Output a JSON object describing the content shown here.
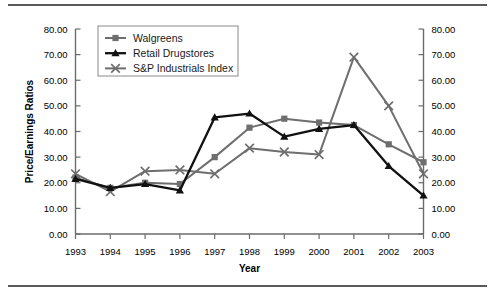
{
  "chart_data": {
    "type": "line",
    "title": "",
    "xlabel": "Year",
    "ylabel": "Price/Earnings Ratios",
    "ylabel_right": "",
    "categories": [
      "1993",
      "1994",
      "1995",
      "1996",
      "1997",
      "1998",
      "1999",
      "2000",
      "2001",
      "2002",
      "2003"
    ],
    "ylim": [
      0,
      80
    ],
    "ytick_step": 10,
    "ytick_labels": [
      "0.00",
      "10.00",
      "20.00",
      "30.00",
      "40.00",
      "50.00",
      "60.00",
      "70.00",
      "80.00"
    ],
    "ytick_labels_right": [
      "0.00",
      "10.00",
      "20.00",
      "30.00",
      "40.00",
      "50.00",
      "60.00",
      "70.00",
      "80.00"
    ],
    "grid": false,
    "dual_axis": true,
    "legend_position": "top-left-inside",
    "series": [
      {
        "name": "Walgreens",
        "color": "#6e6e6e",
        "marker": "square",
        "values": [
          22.0,
          18.0,
          20.0,
          19.5,
          30.0,
          41.5,
          45.0,
          43.5,
          42.5,
          35.0,
          28.0
        ]
      },
      {
        "name": "Retail Drugstores",
        "color": "#111111",
        "marker": "triangle",
        "values": [
          21.5,
          18.0,
          19.5,
          17.0,
          45.5,
          47.0,
          38.0,
          41.0,
          42.5,
          26.5,
          15.0
        ]
      },
      {
        "name": "S&P Industrials Index",
        "color": "#6e6e6e",
        "marker": "cross",
        "values": [
          23.5,
          16.5,
          24.5,
          25.0,
          23.5,
          33.5,
          32.0,
          31.0,
          69.0,
          50.0,
          23.5
        ]
      }
    ]
  },
  "legend": {
    "items": [
      {
        "label": "Walgreens"
      },
      {
        "label": "Retail Drugstores"
      },
      {
        "label": "S&P Industrials Index"
      }
    ]
  }
}
